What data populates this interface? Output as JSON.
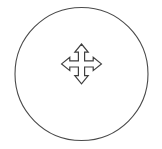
{
  "canvas": {
    "width": 162,
    "height": 149,
    "background_color": "#ffffff"
  },
  "icon_button": {
    "name": "move-tool-button",
    "accessible_label": "Move",
    "tooltip": "Move",
    "state": "default"
  },
  "ring": {
    "name": "circle-outline",
    "center_x": 81.5,
    "center_y": 74,
    "radius": 66.5,
    "stroke_color": "#4a4a4a",
    "stroke_width": 1.1,
    "fill": "none"
  },
  "glyph": {
    "name": "move-arrows-icon",
    "semantic": "four-directional-move-arrow",
    "directions": [
      "up",
      "right",
      "down",
      "left"
    ],
    "stroke_color": "#3f3f3f",
    "stroke_width": 1.2,
    "fill": "none",
    "bounds": {
      "x": 58,
      "y": 44,
      "width": 47,
      "height": 53
    },
    "center_x": 81.5,
    "center_y": 70.5
  }
}
